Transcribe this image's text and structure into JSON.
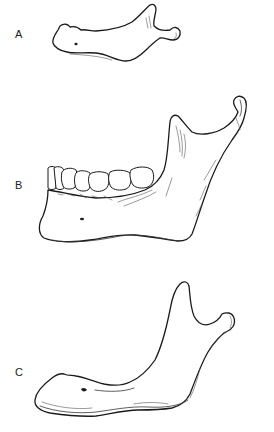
{
  "figure": {
    "panels": [
      {
        "id": "A",
        "label": "A",
        "description": "Mandible of newborn (no erupted teeth)"
      },
      {
        "id": "B",
        "label": "B",
        "description": "Adult mandible with teeth"
      },
      {
        "id": "C",
        "label": "C",
        "description": "Edentulous aged mandible"
      }
    ],
    "colors": {
      "line": "#1a1a1a",
      "background": "#ffffff",
      "label": "#222222"
    }
  }
}
